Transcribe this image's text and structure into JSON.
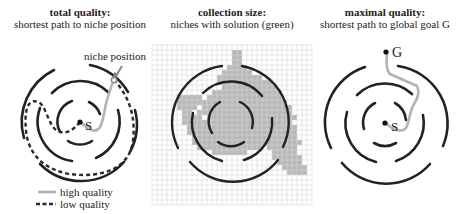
{
  "panels": [
    {
      "id": "total-quality",
      "title": "total quality:",
      "subtitle": "shortest path to niche position",
      "annotation": "niche position",
      "start_label": "S",
      "legend": [
        {
          "label": "high quality",
          "style": "solid",
          "color": "#b3b3b3"
        },
        {
          "label": "low quality",
          "style": "dashed",
          "color": "#2a2a2a"
        }
      ]
    },
    {
      "id": "collection-size",
      "title": "collection size:",
      "subtitle": "niches with solution (green)",
      "grid": {
        "cols": 32,
        "rows": 32,
        "cell_px": 5,
        "fill_color": "#b8b8b8",
        "line_color": "#d4d4d4"
      }
    },
    {
      "id": "maximal-quality",
      "title": "maximal quality:",
      "subtitle": "shortest path to global goal G",
      "start_label": "S",
      "goal_label": "G"
    }
  ],
  "colors": {
    "wall": "#222222",
    "high_quality_path": "#b3b3b3",
    "low_quality_path": "#2a2a2a",
    "niche_fill": "#b8b8b8",
    "grid_line": "#d6d6d6"
  }
}
